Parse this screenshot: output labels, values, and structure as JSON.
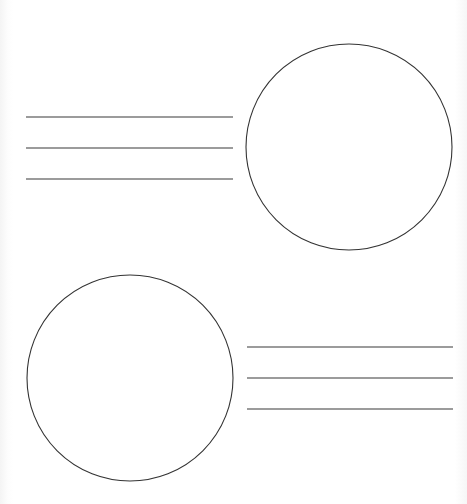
{
  "worksheet": {
    "blocks": [
      {
        "id": "block-top",
        "lines": [
          {
            "x1": 26,
            "x2": 233,
            "y": 117
          },
          {
            "x1": 26,
            "x2": 233,
            "y": 148
          },
          {
            "x1": 26,
            "x2": 233,
            "y": 179
          }
        ],
        "circle": {
          "cx": 349,
          "cy": 147,
          "r": 103
        }
      },
      {
        "id": "block-bottom",
        "lines": [
          {
            "x1": 247,
            "x2": 453,
            "y": 347
          },
          {
            "x1": 247,
            "x2": 453,
            "y": 378
          },
          {
            "x1": 247,
            "x2": 453,
            "y": 409
          }
        ],
        "circle": {
          "cx": 130,
          "cy": 378,
          "r": 103
        }
      }
    ],
    "colors": {
      "line": "#7a7a7a",
      "circle": "#333333",
      "background": "#ffffff"
    }
  }
}
